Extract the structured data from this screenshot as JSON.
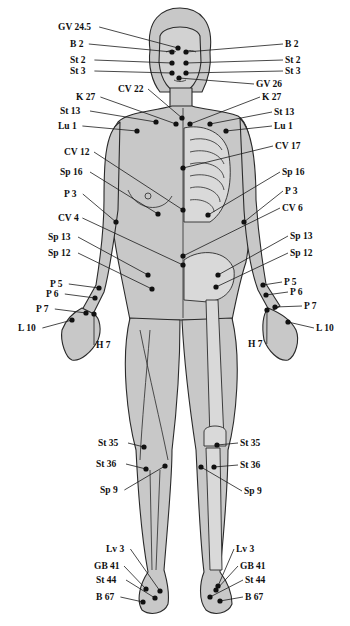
{
  "diagram": {
    "colors": {
      "skin": "#c8c8c8",
      "outline": "#2a2a2a",
      "bone": "#d9d9d9",
      "point": "#111111",
      "background": "#ffffff"
    },
    "points": [
      {
        "id": "gv245",
        "label": "GV 24.5",
        "px": 178,
        "py": 48,
        "lx": 58,
        "ly": 27,
        "side": "l"
      },
      {
        "id": "b2l",
        "label": "B 2",
        "px": 172,
        "py": 52,
        "lx": 70,
        "ly": 44,
        "side": "l"
      },
      {
        "id": "b2r",
        "label": "B 2",
        "px": 186,
        "py": 52,
        "lx": 285,
        "ly": 44,
        "side": "r"
      },
      {
        "id": "st2l",
        "label": "St 2",
        "px": 172,
        "py": 63,
        "lx": 70,
        "ly": 60,
        "side": "l"
      },
      {
        "id": "st2r",
        "label": "St 2",
        "px": 186,
        "py": 63,
        "lx": 285,
        "ly": 60,
        "side": "r"
      },
      {
        "id": "st3l",
        "label": "St 3",
        "px": 172,
        "py": 73,
        "lx": 70,
        "ly": 71,
        "side": "l"
      },
      {
        "id": "st3r",
        "label": "St 3",
        "px": 186,
        "py": 73,
        "lx": 285,
        "ly": 71,
        "side": "r"
      },
      {
        "id": "gv26",
        "label": "GV 26",
        "px": 179,
        "py": 78,
        "lx": 256,
        "ly": 84,
        "side": "r"
      },
      {
        "id": "cv22",
        "label": "CV 22",
        "px": 182,
        "py": 118,
        "lx": 118,
        "ly": 89,
        "side": "l"
      },
      {
        "id": "k27l",
        "label": "K 27",
        "px": 176,
        "py": 124,
        "lx": 76,
        "ly": 97,
        "side": "l"
      },
      {
        "id": "k27r",
        "label": "K 27",
        "px": 190,
        "py": 124,
        "lx": 262,
        "ly": 97,
        "side": "r"
      },
      {
        "id": "st13l",
        "label": "St 13",
        "px": 156,
        "py": 122,
        "lx": 60,
        "ly": 111,
        "side": "l"
      },
      {
        "id": "st13r",
        "label": "St 13",
        "px": 210,
        "py": 124,
        "lx": 274,
        "ly": 112,
        "side": "r"
      },
      {
        "id": "lu1l",
        "label": "Lu 1",
        "px": 137,
        "py": 131,
        "lx": 58,
        "ly": 126,
        "side": "l"
      },
      {
        "id": "lu1r",
        "label": "Lu 1",
        "px": 226,
        "py": 131,
        "lx": 274,
        "ly": 126,
        "side": "r"
      },
      {
        "id": "cv17",
        "label": "CV 17",
        "px": 183,
        "py": 168,
        "lx": 275,
        "ly": 146,
        "side": "r"
      },
      {
        "id": "cv12",
        "label": "CV 12",
        "px": 183,
        "py": 210,
        "lx": 64,
        "ly": 152,
        "side": "l"
      },
      {
        "id": "sp16l",
        "label": "Sp 16",
        "px": 158,
        "py": 214,
        "lx": 60,
        "ly": 172,
        "side": "l"
      },
      {
        "id": "sp16r",
        "label": "Sp 16",
        "px": 208,
        "py": 215,
        "lx": 282,
        "ly": 172,
        "side": "r"
      },
      {
        "id": "p3l",
        "label": "P 3",
        "px": 116,
        "py": 222,
        "lx": 64,
        "ly": 194,
        "side": "l"
      },
      {
        "id": "p3r",
        "label": "P 3",
        "px": 244,
        "py": 222,
        "lx": 285,
        "ly": 191,
        "side": "r"
      },
      {
        "id": "cv6",
        "label": "CV 6",
        "px": 183,
        "py": 256,
        "lx": 282,
        "ly": 208,
        "side": "r"
      },
      {
        "id": "cv4",
        "label": "CV 4",
        "px": 183,
        "py": 265,
        "lx": 58,
        "ly": 218,
        "side": "l"
      },
      {
        "id": "sp13l",
        "label": "Sp 13",
        "px": 148,
        "py": 275,
        "lx": 48,
        "ly": 237,
        "side": "l"
      },
      {
        "id": "sp13r",
        "label": "Sp 13",
        "px": 218,
        "py": 275,
        "lx": 290,
        "ly": 236,
        "side": "r"
      },
      {
        "id": "sp12l",
        "label": "Sp 12",
        "px": 152,
        "py": 289,
        "lx": 48,
        "ly": 253,
        "side": "l"
      },
      {
        "id": "sp12r",
        "label": "Sp 12",
        "px": 216,
        "py": 287,
        "lx": 290,
        "ly": 253,
        "side": "r"
      },
      {
        "id": "p5l",
        "label": "P 5",
        "px": 99,
        "py": 288,
        "lx": 50,
        "ly": 284,
        "side": "l"
      },
      {
        "id": "p5r",
        "label": "P 5",
        "px": 263,
        "py": 285,
        "lx": 284,
        "ly": 282,
        "side": "r"
      },
      {
        "id": "p6l",
        "label": "P 6",
        "px": 95,
        "py": 298,
        "lx": 46,
        "ly": 294,
        "side": "l"
      },
      {
        "id": "p6r",
        "label": "P 6",
        "px": 266,
        "py": 295,
        "lx": 290,
        "ly": 292,
        "side": "r"
      },
      {
        "id": "p7l",
        "label": "P 7",
        "px": 86,
        "py": 313,
        "lx": 36,
        "ly": 309,
        "side": "l"
      },
      {
        "id": "p7r",
        "label": "P 7",
        "px": 275,
        "py": 307,
        "lx": 304,
        "ly": 306,
        "side": "r"
      },
      {
        "id": "h7l",
        "label": "H 7",
        "px": 94,
        "py": 314,
        "lx": 96,
        "ly": 345,
        "side": "r"
      },
      {
        "id": "h7r",
        "label": "H 7",
        "px": 267,
        "py": 310,
        "lx": 248,
        "ly": 344,
        "side": "l"
      },
      {
        "id": "l10l",
        "label": "L 10",
        "px": 72,
        "py": 320,
        "lx": 18,
        "ly": 328,
        "side": "l"
      },
      {
        "id": "l10r",
        "label": "L 10",
        "px": 288,
        "py": 322,
        "lx": 316,
        "ly": 328,
        "side": "r"
      },
      {
        "id": "st35l",
        "label": "St 35",
        "px": 144,
        "py": 447,
        "lx": 98,
        "ly": 443,
        "side": "l"
      },
      {
        "id": "st35r",
        "label": "St 35",
        "px": 217,
        "py": 445,
        "lx": 240,
        "ly": 443,
        "side": "r"
      },
      {
        "id": "st36l",
        "label": "St 36",
        "px": 146,
        "py": 469,
        "lx": 96,
        "ly": 464,
        "side": "l"
      },
      {
        "id": "st36r",
        "label": "St 36",
        "px": 214,
        "py": 467,
        "lx": 240,
        "ly": 465,
        "side": "r"
      },
      {
        "id": "sp9l",
        "label": "Sp 9",
        "px": 165,
        "py": 466,
        "lx": 100,
        "ly": 490,
        "side": "l"
      },
      {
        "id": "sp9r",
        "label": "Sp 9",
        "px": 201,
        "py": 467,
        "lx": 244,
        "ly": 491,
        "side": "r"
      },
      {
        "id": "lv3l",
        "label": "Lv 3",
        "px": 160,
        "py": 591,
        "lx": 106,
        "ly": 549,
        "side": "l"
      },
      {
        "id": "lv3r",
        "label": "Lv 3",
        "px": 218,
        "py": 586,
        "lx": 236,
        "ly": 549,
        "side": "r"
      },
      {
        "id": "gb41l",
        "label": "GB 41",
        "px": 146,
        "py": 589,
        "lx": 94,
        "ly": 566,
        "side": "l"
      },
      {
        "id": "gb41r",
        "label": "GB 41",
        "px": 216,
        "py": 590,
        "lx": 240,
        "ly": 566,
        "side": "r"
      },
      {
        "id": "st44l",
        "label": "St 44",
        "px": 155,
        "py": 598,
        "lx": 96,
        "ly": 580,
        "side": "l"
      },
      {
        "id": "st44r",
        "label": "St 44",
        "px": 210,
        "py": 597,
        "lx": 245,
        "ly": 580,
        "side": "r"
      },
      {
        "id": "b67l",
        "label": "B 67",
        "px": 143,
        "py": 602,
        "lx": 96,
        "ly": 597,
        "side": "l"
      },
      {
        "id": "b67r",
        "label": "B 67",
        "px": 220,
        "py": 601,
        "lx": 245,
        "ly": 597,
        "side": "r"
      }
    ]
  }
}
